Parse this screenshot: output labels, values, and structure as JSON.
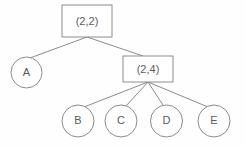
{
  "diagram": {
    "type": "tree",
    "title": "",
    "background_color": "#fefefe",
    "stroke_color": "#8c8c8c",
    "text_color": "#5b5b5b",
    "nodes": [
      {
        "id": "root",
        "label": "(2,2)",
        "shape": "rectangle",
        "x": 62,
        "y": 5,
        "width": 50,
        "height": 32,
        "level": 0
      },
      {
        "id": "a",
        "label": "A",
        "shape": "circle",
        "cx": 26.5,
        "cy": 72.5,
        "r": 15.5,
        "level": 1
      },
      {
        "id": "inner",
        "label": "(2,4)",
        "shape": "rectangle",
        "x": 123,
        "y": 56,
        "width": 50,
        "height": 26,
        "level": 1
      },
      {
        "id": "b",
        "label": "B",
        "shape": "circle",
        "cx": 78,
        "cy": 121,
        "r": 16,
        "level": 2
      },
      {
        "id": "c",
        "label": "C",
        "shape": "circle",
        "cx": 121,
        "cy": 121,
        "r": 16,
        "level": 2
      },
      {
        "id": "d",
        "label": "D",
        "shape": "circle",
        "cx": 166.5,
        "cy": 121,
        "r": 16,
        "level": 2
      },
      {
        "id": "e",
        "label": "E",
        "shape": "circle",
        "cx": 214,
        "cy": 121,
        "r": 16,
        "level": 2
      }
    ],
    "edges": [
      {
        "id": "root-a",
        "from": "root",
        "to": "a",
        "x1": 87,
        "y1": 37,
        "x2": 30,
        "y2": 58
      },
      {
        "id": "root-inner",
        "from": "root",
        "to": "inner",
        "x1": 87,
        "y1": 37,
        "x2": 143,
        "y2": 56
      },
      {
        "id": "inner-b",
        "from": "inner",
        "to": "b",
        "x1": 148,
        "y1": 82,
        "x2": 84,
        "y2": 107
      },
      {
        "id": "inner-c",
        "from": "inner",
        "to": "c",
        "x1": 148,
        "y1": 82,
        "x2": 126,
        "y2": 106
      },
      {
        "id": "inner-d",
        "from": "inner",
        "to": "d",
        "x1": 148,
        "y1": 82,
        "x2": 163,
        "y2": 105
      },
      {
        "id": "inner-e",
        "from": "inner",
        "to": "e",
        "x1": 148,
        "y1": 82,
        "x2": 208,
        "y2": 107
      }
    ]
  }
}
